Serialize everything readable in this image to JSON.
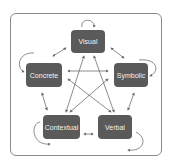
{
  "diagram": {
    "colors": {
      "node_fill": "#5a5a5a",
      "node_text": "#f2f2f2",
      "arrow": "#6e6e6e",
      "frame": "#8a8a8a"
    },
    "nodes": [
      {
        "id": "visual",
        "label": "Visual"
      },
      {
        "id": "concrete",
        "label": "Concrete"
      },
      {
        "id": "symbolic",
        "label": "Symbolic"
      },
      {
        "id": "contextual",
        "label": "Contextual"
      },
      {
        "id": "verbal",
        "label": "Verbal"
      }
    ],
    "edges": [
      {
        "from": "visual",
        "to": "concrete",
        "type": "bidirectional"
      },
      {
        "from": "visual",
        "to": "symbolic",
        "type": "bidirectional"
      },
      {
        "from": "visual",
        "to": "contextual",
        "type": "bidirectional"
      },
      {
        "from": "visual",
        "to": "verbal",
        "type": "bidirectional"
      },
      {
        "from": "concrete",
        "to": "symbolic",
        "type": "bidirectional"
      },
      {
        "from": "concrete",
        "to": "contextual",
        "type": "bidirectional"
      },
      {
        "from": "concrete",
        "to": "verbal",
        "type": "bidirectional"
      },
      {
        "from": "symbolic",
        "to": "contextual",
        "type": "bidirectional"
      },
      {
        "from": "symbolic",
        "to": "verbal",
        "type": "bidirectional"
      },
      {
        "from": "contextual",
        "to": "verbal",
        "type": "bidirectional"
      }
    ],
    "self_loops": [
      "visual",
      "concrete",
      "symbolic",
      "contextual",
      "verbal"
    ]
  }
}
